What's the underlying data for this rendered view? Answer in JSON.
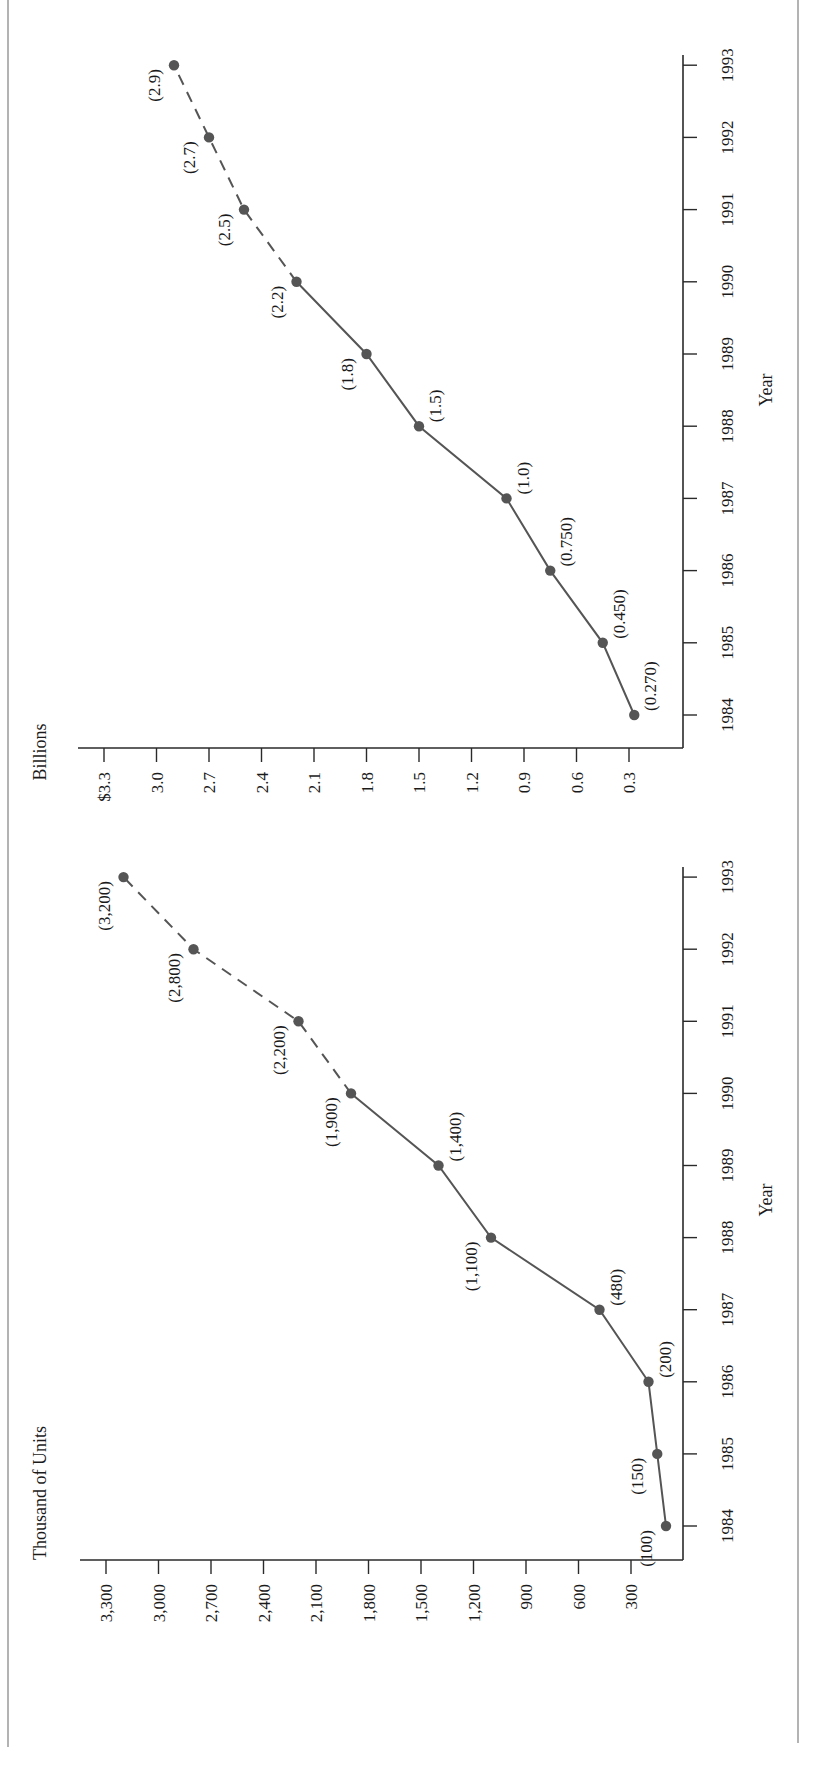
{
  "page": {
    "orientation": "rotated-90-ccw",
    "colors": {
      "line": "#555555",
      "axis": "#2a2a2a",
      "border": "#8a8a8a",
      "text": "#1a1a1a"
    }
  },
  "chart_data": [
    {
      "type": "line",
      "title": "",
      "ylabel": "Billions",
      "xlabel": "Year",
      "x": [
        "1984",
        "1985",
        "1986",
        "1987",
        "1988",
        "1989",
        "1990",
        "1991",
        "1992",
        "1993"
      ],
      "series": [
        {
          "name": "Billions",
          "values": [
            0.27,
            0.45,
            0.75,
            1.0,
            1.5,
            1.8,
            2.2,
            2.5,
            2.7,
            2.9
          ],
          "labels": [
            "(0.270)",
            "(0.450)",
            "(0.750)",
            "(1.0)",
            "(1.5)",
            "(1.8)",
            "(2.2)",
            "(2.5)",
            "(2.7)",
            "(2.9)"
          ],
          "label_side": [
            "below",
            "below",
            "below",
            "below",
            "below",
            "above",
            "above",
            "above",
            "above",
            "above"
          ],
          "dashed_from_index": 6
        }
      ],
      "y_ticks": [
        "$3.3",
        "3.0",
        "2.7",
        "2.4",
        "2.1",
        "1.8",
        "1.5",
        "1.2",
        "0.9",
        "0.6",
        "0.3"
      ],
      "y_tick_values": [
        3.3,
        3.0,
        2.7,
        2.4,
        2.1,
        1.8,
        1.5,
        1.2,
        0.9,
        0.6,
        0.3
      ],
      "ylim": [
        0,
        3.3
      ],
      "grid": false,
      "legend": "none",
      "layout": {
        "corner_x": 683,
        "corner_y": 748,
        "axis_top_y": 55,
        "axis_left_x": 78,
        "year0_y": 715,
        "year_step": -72.2,
        "tick_ref_value": 0.3,
        "tick_ref_x": 629,
        "px_per_unit": 175,
        "ylabel_x": 40,
        "ylabel_y": 752,
        "xlabel_x": 778,
        "xlabel_y": 390
      }
    },
    {
      "type": "line",
      "title": "",
      "ylabel": "Thousand of Units",
      "xlabel": "Year",
      "x": [
        "1984",
        "1985",
        "1986",
        "1987",
        "1988",
        "1989",
        "1990",
        "1991",
        "1992",
        "1993"
      ],
      "series": [
        {
          "name": "Thousand of Units",
          "values": [
            100,
            150,
            200,
            480,
            1100,
            1400,
            1900,
            2200,
            2800,
            3200
          ],
          "labels": [
            "(100)",
            "(150)",
            "(200)",
            "(480)",
            "(1,100)",
            "(1,400)",
            "(1,900)",
            "(2,200)",
            "(2,800)",
            "(3,200)"
          ],
          "label_side": [
            "above",
            "above",
            "below",
            "below",
            "above",
            "below",
            "above",
            "above",
            "above",
            "above"
          ],
          "dashed_from_index": 6
        }
      ],
      "y_ticks": [
        "3,300",
        "3,000",
        "2,700",
        "2,400",
        "2,100",
        "1,800",
        "1,500",
        "1,200",
        "900",
        "600",
        "300"
      ],
      "y_tick_values": [
        3300,
        3000,
        2700,
        2400,
        2100,
        1800,
        1500,
        1200,
        900,
        600,
        300
      ],
      "ylim": [
        0,
        3300
      ],
      "grid": false,
      "legend": "none",
      "layout": {
        "corner_x": 683,
        "corner_y": 1560,
        "axis_top_y": 867,
        "axis_left_x": 80,
        "year0_y": 1526,
        "year_step": -72.1,
        "tick_ref_value": 300,
        "tick_ref_x": 631,
        "px_per_unit": 0.175,
        "ylabel_x": 40,
        "ylabel_y": 1560,
        "xlabel_x": 778,
        "xlabel_y": 1200
      }
    }
  ]
}
